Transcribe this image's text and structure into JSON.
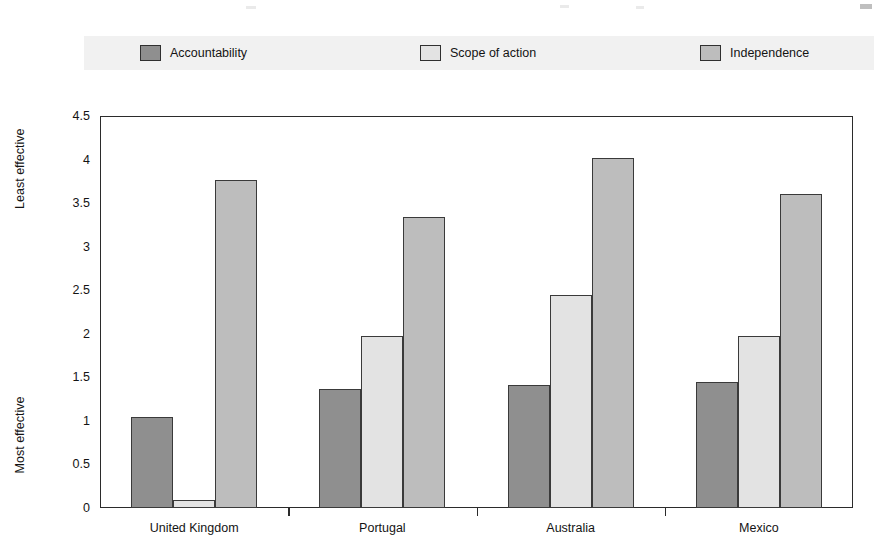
{
  "legend": {
    "items": [
      {
        "label": "Accountability",
        "color": "#8f8f8f"
      },
      {
        "label": "Scope of action",
        "color": "#e3e3e3"
      },
      {
        "label": "Independence",
        "color": "#bdbdbd"
      }
    ]
  },
  "axis": {
    "y_caption_top": "Least effective",
    "y_caption_bottom": "Most effective",
    "y_ticks": [
      "4.5",
      "4",
      "3.5",
      "3",
      "2.5",
      "2",
      "1.5",
      "1",
      "0.5",
      "0"
    ]
  },
  "chart_data": {
    "type": "bar",
    "title": "",
    "subtitle": "",
    "xlabel": "",
    "ylabel": "",
    "ylim": [
      0,
      4.5
    ],
    "ytick_values": [
      0,
      0.5,
      1,
      1.5,
      2,
      2.5,
      3,
      3.5,
      4,
      4.5
    ],
    "grid": false,
    "legend_position": "top",
    "y_axis_annotations": {
      "top": "Least effective",
      "bottom": "Most effective"
    },
    "categories": [
      "United Kingdom",
      "Portugal",
      "Australia",
      "Mexico"
    ],
    "series": [
      {
        "name": "Accountability",
        "color": "#8f8f8f",
        "values": [
          1.05,
          1.37,
          1.41,
          1.45
        ]
      },
      {
        "name": "Scope of action",
        "color": "#e3e3e3",
        "values": [
          0.09,
          1.97,
          2.44,
          1.97
        ]
      },
      {
        "name": "Independence",
        "color": "#bdbdbd",
        "values": [
          3.77,
          3.34,
          4.02,
          3.6
        ]
      }
    ]
  }
}
